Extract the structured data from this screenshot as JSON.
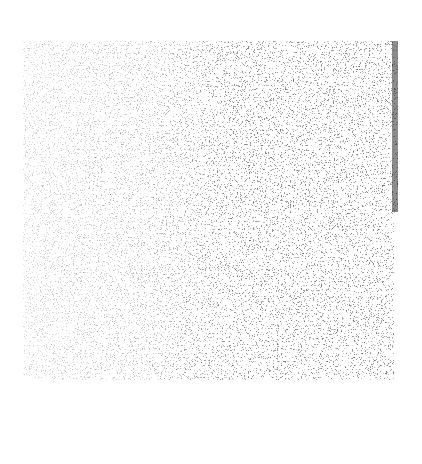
{
  "image": {
    "description": "Grainy grayscale noise texture (speckle/stipple pattern) on white background",
    "background_color": "#ffffff",
    "texture": {
      "region": {
        "left": 23,
        "top": 41,
        "right_upper": 398,
        "right_lower": 394,
        "step_y": 212,
        "bottom": 380
      },
      "ink_color": "#000000",
      "density_gradient": "light on left, darker on right",
      "edge_strip": "darker vertical band along right edge in upper half"
    }
  }
}
